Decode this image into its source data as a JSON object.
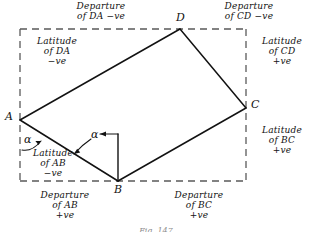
{
  "figure": {
    "title_caption": "Fig. 147",
    "vertices": [
      {
        "id": "A",
        "label": "A",
        "x": 20,
        "y": 120
      },
      {
        "id": "B",
        "label": "B",
        "x": 118,
        "y": 181
      },
      {
        "id": "C",
        "label": "C",
        "x": 246,
        "y": 108
      },
      {
        "id": "D",
        "label": "D",
        "x": 180,
        "y": 29
      }
    ],
    "angles": [
      {
        "id": "alpha-at-A",
        "label": "α"
      },
      {
        "id": "alpha-at-B",
        "label": "α"
      }
    ],
    "annotations": {
      "departure_DA": "Departure\nof DA −ve",
      "departure_CD": "Departure\nof CD −ve",
      "latitude_DA": "Latitude\nof DA\n−ve",
      "latitude_CD": "Latitude\nof CD\n+ve",
      "latitude_BC": "Latitude\nof BC\n+ve",
      "latitude_AB": "Latitude\nof AB\n−ve",
      "departure_AB": "Departure\nof AB\n+ve",
      "departure_BC": "Departure\nof BC\n+ve"
    },
    "colors": {
      "ink": "#121212",
      "dashed": "#5a5a5a",
      "background": "#ffffff"
    }
  }
}
